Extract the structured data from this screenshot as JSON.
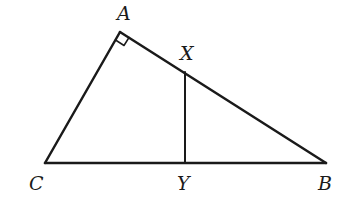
{
  "diagram": {
    "points": {
      "A": {
        "label": "A",
        "x": 120,
        "y": 32
      },
      "B": {
        "label": "B",
        "x": 326,
        "y": 163
      },
      "C": {
        "label": "C",
        "x": 45,
        "y": 163
      },
      "X": {
        "label": "X",
        "x": 185,
        "y": 72
      },
      "Y": {
        "label": "Y",
        "x": 185,
        "y": 163
      }
    },
    "segments": [
      "AB",
      "AC",
      "CB",
      "XY"
    ],
    "right_angle_at": "A",
    "stroke_color": "#1a1a1a"
  }
}
